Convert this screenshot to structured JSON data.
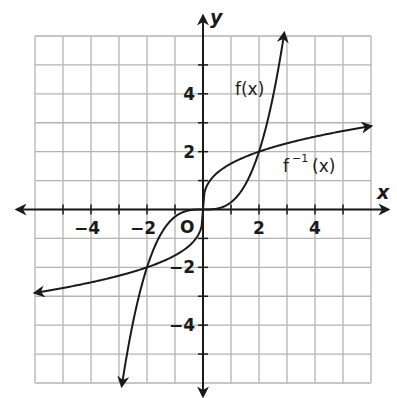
{
  "chart_data": {
    "type": "line",
    "title": "",
    "xlabel": "x",
    "ylabel": "y",
    "xlim": [
      -6,
      6
    ],
    "ylim": [
      -6,
      6
    ],
    "grid": true,
    "grid_step": 1,
    "origin_label": "O",
    "x_ticks": [
      {
        "value": -4,
        "label": "−4"
      },
      {
        "value": -2,
        "label": "−2"
      },
      {
        "value": 2,
        "label": "2"
      },
      {
        "value": 4,
        "label": "4"
      }
    ],
    "y_ticks": [
      {
        "value": 4,
        "label": "4"
      },
      {
        "value": 2,
        "label": "2"
      },
      {
        "value": -2,
        "label": "−2"
      },
      {
        "value": -4,
        "label": "−4"
      }
    ],
    "series": [
      {
        "name": "f(x)",
        "label_main": "f(x)",
        "expression": "x^3/4",
        "x_range": [
          -2.9,
          2.9
        ],
        "points": [
          [
            -2.9,
            -6.1
          ],
          [
            -2,
            -2
          ],
          [
            -1,
            -0.25
          ],
          [
            0,
            0
          ],
          [
            1,
            0.25
          ],
          [
            2,
            2
          ],
          [
            2.9,
            6.1
          ]
        ],
        "arrows_both_ends": true
      },
      {
        "name": "f^-1(x)",
        "label_main": "f",
        "label_sup": "−1",
        "label_tail": "(x)",
        "expression": "cbrt(4x)",
        "x_range": [
          -6,
          6
        ],
        "points": [
          [
            -6,
            -2.88
          ],
          [
            -2,
            -2
          ],
          [
            -0.25,
            -1
          ],
          [
            0,
            0
          ],
          [
            0.25,
            1
          ],
          [
            2,
            2
          ],
          [
            6,
            2.88
          ]
        ],
        "arrows_both_ends": true
      }
    ],
    "intersections": [
      [
        -2,
        -2
      ],
      [
        0,
        0
      ],
      [
        2,
        2
      ]
    ],
    "colors": {
      "grid": "#b3b3b3",
      "axes": "#1a1a1a",
      "curves": "#1a1a1a"
    }
  }
}
